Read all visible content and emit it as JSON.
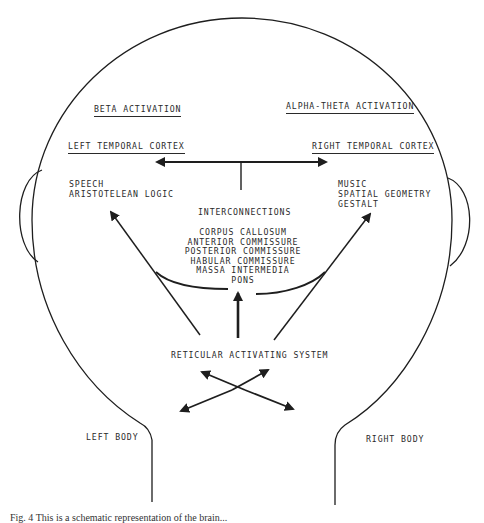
{
  "diagram": {
    "headers": {
      "left_activation": "BETA ACTIVATION",
      "right_activation": "ALPHA-THETA ACTIVATION",
      "left_cortex": "LEFT TEMPORAL CORTEX",
      "right_cortex": "RIGHT TEMPORAL CORTEX"
    },
    "left_functions": [
      "SPEECH",
      "ARISTOTELEAN LOGIC"
    ],
    "right_functions": [
      "MUSIC",
      "SPATIAL GEOMETRY",
      "GESTALT"
    ],
    "interconnections": {
      "title": "INTERCONNECTIONS",
      "items": [
        "CORPUS CALLOSUM",
        "ANTERIOR COMMISSURE",
        "POSTERIOR COMMISSURE",
        "HABULAR COMMISSURE",
        "MASSA INTERMEDIA",
        "PONS"
      ]
    },
    "reticular": "RETICULAR ACTIVATING SYSTEM",
    "body": {
      "left": "LEFT BODY",
      "right": "RIGHT BODY"
    },
    "caption": "Fig. 4 This is a schematic representation of the brain..."
  },
  "colors": {
    "ink": "#2a2a2a",
    "background": "#ffffff"
  }
}
